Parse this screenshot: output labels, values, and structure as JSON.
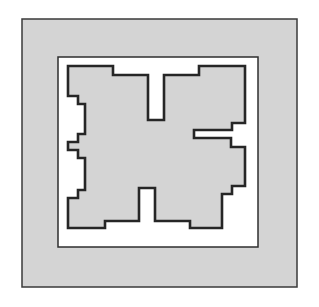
{
  "figure": {
    "kind": "architectural-floor-plan",
    "title": "",
    "caption": "",
    "canvas": {
      "width": 319,
      "height": 307
    },
    "background_color": "#ffffff"
  },
  "colors": {
    "page_background": "#ffffff",
    "outer_panel_fill": "#d4d4d4",
    "outer_panel_stroke": "#3a3a3a",
    "inner_frame_fill": "#ffffff",
    "inner_frame_stroke": "#2e2e2e",
    "structure_fill": "#d4d4d4",
    "structure_stroke": "#262626",
    "void_fill": "#ffffff"
  },
  "geometry": {
    "outer_panel": {
      "x": 22,
      "y": 19,
      "width": 275,
      "height": 268,
      "stroke_width": 1.5
    },
    "inner_frame": {
      "x": 58,
      "y": 57,
      "width": 200,
      "height": 190,
      "stroke_width": 1.5
    },
    "structure_stroke_width": 2.6,
    "structure_outline": [
      [
        68,
        66
      ],
      [
        113,
        66
      ],
      [
        113,
        75
      ],
      [
        148,
        75
      ],
      [
        148,
        120
      ],
      [
        164,
        120
      ],
      [
        164,
        75
      ],
      [
        199,
        75
      ],
      [
        199,
        66
      ],
      [
        245,
        66
      ],
      [
        245,
        123
      ],
      [
        232,
        123
      ],
      [
        232,
        130
      ],
      [
        194,
        130
      ],
      [
        194,
        138
      ],
      [
        231,
        138
      ],
      [
        231,
        147
      ],
      [
        245,
        147
      ],
      [
        245,
        186
      ],
      [
        232,
        186
      ],
      [
        232,
        194
      ],
      [
        222,
        194
      ],
      [
        222,
        228
      ],
      [
        190,
        228
      ],
      [
        190,
        221
      ],
      [
        155,
        221
      ],
      [
        155,
        188
      ],
      [
        139,
        188
      ],
      [
        139,
        221
      ],
      [
        105,
        221
      ],
      [
        105,
        228
      ],
      [
        68,
        228
      ],
      [
        68,
        198
      ],
      [
        78,
        198
      ],
      [
        78,
        190
      ],
      [
        85,
        190
      ],
      [
        85,
        158
      ],
      [
        78,
        158
      ],
      [
        78,
        150
      ],
      [
        68,
        150
      ],
      [
        68,
        142
      ],
      [
        78,
        142
      ],
      [
        78,
        134
      ],
      [
        85,
        134
      ],
      [
        85,
        104
      ],
      [
        78,
        104
      ],
      [
        78,
        96
      ],
      [
        68,
        96
      ]
    ]
  },
  "annotations": {
    "scale_label": "",
    "north_label": "",
    "figure_number": ""
  }
}
